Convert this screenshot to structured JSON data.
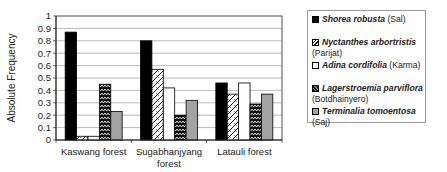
{
  "chart_data": {
    "type": "bar",
    "title": "",
    "xlabel": "",
    "ylabel": "Absolute Frequency",
    "ylim": [
      0,
      1
    ],
    "yticks": [
      "0",
      "0.1",
      "0.2",
      "0.3",
      "0.4",
      "0.5",
      "0.6",
      "0.7",
      "0.8",
      "0.9",
      "1"
    ],
    "ytick_values": [
      0,
      0.1,
      0.2,
      0.3,
      0.4,
      0.5,
      0.6,
      0.7,
      0.8,
      0.9,
      1.0
    ],
    "grid": true,
    "legend_position": "right",
    "categories": [
      [
        "Kaswang forest"
      ],
      [
        "Sugabhanjyang",
        "forest"
      ],
      [
        "Latauli forest"
      ]
    ],
    "series": [
      {
        "name": "Shorea robusta",
        "common": "(Sal)",
        "pattern": "solid-black",
        "values": [
          0.87,
          0.8,
          0.46
        ]
      },
      {
        "name": "Nyctanthes arbortristis",
        "common": "(Parijat)",
        "pattern": "diagonal-hatch",
        "values": [
          0.03,
          0.57,
          0.37
        ]
      },
      {
        "name": "Adina cordifolia",
        "common": "(Karma)",
        "pattern": "white",
        "values": [
          0.03,
          0.42,
          0.46
        ]
      },
      {
        "name": "Lagerstroemia parviflora",
        "common": "(Botdhainyero)",
        "pattern": "zigzag",
        "values": [
          0.45,
          0.2,
          0.29
        ]
      },
      {
        "name": "Terminalia tomoentosa",
        "common": "(Saj)",
        "pattern": "gray",
        "values": [
          0.23,
          0.32,
          0.37
        ]
      }
    ]
  },
  "colors": {
    "solid": "#000000",
    "gray": "#a3a3a3",
    "grid": "#8c8c8c",
    "axis": "#222222"
  }
}
